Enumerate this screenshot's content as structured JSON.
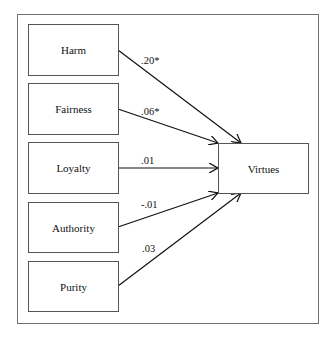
{
  "diagram": {
    "type": "path-diagram",
    "predictors": [
      {
        "label": "Harm",
        "coef": ".20*"
      },
      {
        "label": "Fairness",
        "coef": ".06*"
      },
      {
        "label": "Loyalty",
        "coef": ".01"
      },
      {
        "label": "Authority",
        "coef": "-.01"
      },
      {
        "label": "Purity",
        "coef": ".03"
      }
    ],
    "outcome": {
      "label": "Virtues"
    }
  }
}
